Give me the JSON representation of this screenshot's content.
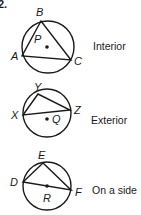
{
  "problem_number": "2.",
  "figures": [
    {
      "caption": "Interior",
      "circle": {
        "cx": 48,
        "cy": 47,
        "r": 26
      },
      "vertices": [
        {
          "label": "B",
          "x": 41,
          "y": 21,
          "lx": 36,
          "ly": 16
        },
        {
          "label": "A",
          "x": 22,
          "y": 56,
          "lx": 11,
          "ly": 60
        },
        {
          "label": "C",
          "x": 71,
          "y": 60,
          "lx": 75,
          "ly": 65
        }
      ],
      "center_point": {
        "label": "P",
        "x": 47,
        "y": 47,
        "lx": 34,
        "ly": 43
      }
    },
    {
      "caption": "Exterior",
      "circle": {
        "cx": 47,
        "cy": 113,
        "r": 24
      },
      "vertices": [
        {
          "label": "Y",
          "x": 38,
          "y": 94,
          "lx": 34,
          "ly": 91
        },
        {
          "label": "X",
          "x": 23,
          "y": 115,
          "lx": 11,
          "ly": 119
        },
        {
          "label": "Z",
          "x": 70,
          "y": 110,
          "lx": 75,
          "ly": 113
        }
      ],
      "center_point": {
        "label": "Q",
        "x": 47,
        "y": 118,
        "lx": 52,
        "ly": 122
      }
    },
    {
      "caption": "On a side",
      "circle": {
        "cx": 47,
        "cy": 186,
        "r": 24
      },
      "vertices": [
        {
          "label": "E",
          "x": 43,
          "y": 163,
          "lx": 38,
          "ly": 159
        },
        {
          "label": "D",
          "x": 23,
          "y": 182,
          "lx": 11,
          "ly": 186
        },
        {
          "label": "F",
          "x": 71,
          "y": 190,
          "lx": 76,
          "ly": 196
        }
      ],
      "center_point": {
        "label": "R",
        "x": 47,
        "y": 186,
        "lx": 43,
        "ly": 202
      }
    }
  ],
  "colors": {
    "ink": "#1a1a1a",
    "background": "#ffffff"
  }
}
